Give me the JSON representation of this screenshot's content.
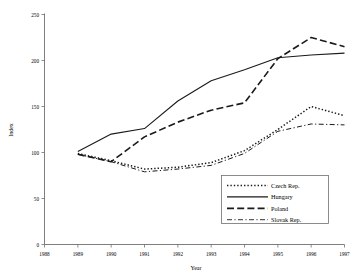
{
  "chart_data": {
    "type": "line",
    "title": "",
    "xlabel": "Year",
    "ylabel": "Index",
    "x": [
      1988,
      1989,
      1990,
      1991,
      1992,
      1993,
      1994,
      1995,
      1996,
      1997
    ],
    "xtick_labels": [
      "1988",
      "1989",
      "1990",
      "1991",
      "1992",
      "1993",
      "1994",
      "1995",
      "1996",
      "1997"
    ],
    "ytick_labels": [
      "0",
      "50",
      "100",
      "150",
      "200",
      "250"
    ],
    "yticks": [
      0,
      50,
      100,
      150,
      200,
      250
    ],
    "ylim": [
      0,
      250
    ],
    "xlim": [
      1988,
      1997
    ],
    "grid": false,
    "legend_position": "bottom-right",
    "series": [
      {
        "name": "Czech Rep.",
        "style": "dotted",
        "x": [
          1989,
          1990,
          1991,
          1992,
          1993,
          1994,
          1995,
          1996,
          1997
        ],
        "values": [
          99,
          91,
          82,
          84,
          89,
          102,
          125,
          150,
          140
        ]
      },
      {
        "name": "Hungary",
        "style": "solid",
        "x": [
          1989,
          1990,
          1991,
          1992,
          1993,
          1994,
          1995,
          1996,
          1997
        ],
        "values": [
          101,
          120,
          126,
          156,
          178,
          190,
          203,
          206,
          208
        ]
      },
      {
        "name": "Poland",
        "style": "dashed",
        "x": [
          1989,
          1990,
          1991,
          1992,
          1993,
          1994,
          1995,
          1996,
          1997
        ],
        "values": [
          98,
          90,
          117,
          133,
          146,
          154,
          202,
          225,
          215
        ]
      },
      {
        "name": "Slovak Rep.",
        "style": "dashdot",
        "x": [
          1989,
          1990,
          1991,
          1992,
          1993,
          1994,
          1995,
          1996,
          1997
        ],
        "values": [
          98,
          90,
          79,
          82,
          86,
          99,
          123,
          131,
          130
        ]
      }
    ]
  },
  "legend": {
    "items": [
      {
        "label": "Czech Rep."
      },
      {
        "label": "Hungary"
      },
      {
        "label": "Poland"
      },
      {
        "label": "Slovak Rep."
      }
    ]
  },
  "axes": {
    "y_title": "Index",
    "x_title": "Year"
  }
}
